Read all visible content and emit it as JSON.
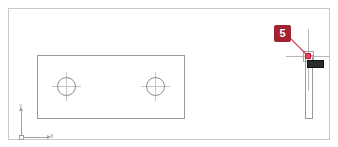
{
  "canvas": {
    "background_color": "#ffffff",
    "border_color": "#c9c9c9"
  },
  "geometry": {
    "plate_top_view": {
      "name": "rectangular-plate-top-view",
      "stroke_color": "#9a9a9a"
    },
    "holes": [
      {
        "name": "left-hole",
        "stroke_color": "#8d8d8d"
      },
      {
        "name": "right-hole",
        "stroke_color": "#8d8d8d"
      }
    ],
    "centerlines": {
      "color": "#c6c6c6"
    },
    "plate_side_view": {
      "name": "plate-side-view",
      "stroke_color": "#9a9a9a"
    }
  },
  "cursor": {
    "crosshair_color": "#b8b8b8",
    "pickbox_color": "#a5a5a5",
    "snap_marker_color": "#e8455a"
  },
  "tooltip": {
    "text": "",
    "background_color": "#2b2b2b",
    "text_color": "#e6e6e6"
  },
  "callout": {
    "number": "5",
    "background_color": "#a32232",
    "text_color": "#ffffff",
    "leader_color": "#c8394f"
  },
  "ucs": {
    "x_label": "X",
    "y_label": "Y",
    "axis_color": "#a0a0a0",
    "label_color": "#8a8a8a"
  }
}
